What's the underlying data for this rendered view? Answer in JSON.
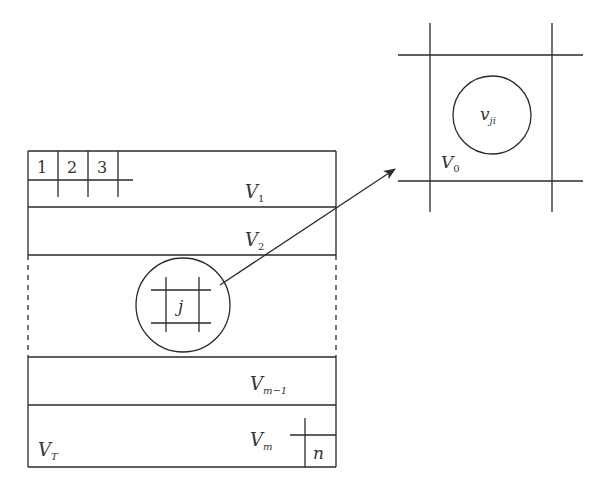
{
  "diagram": {
    "main_grid": {
      "bands": [
        {
          "label": "V",
          "sub": "1"
        },
        {
          "label": "V",
          "sub": "2"
        },
        {
          "label": "V",
          "sub": "m−1"
        },
        {
          "label": "V",
          "sub": "m"
        }
      ],
      "corner_label": {
        "label": "V",
        "sub": "T"
      },
      "top_cells": [
        "1",
        "2",
        "3"
      ],
      "last_cell": "n",
      "zoom_cell_label": "j"
    },
    "detail_view": {
      "cell_label": {
        "label": "V",
        "sub": "0"
      },
      "node_label": {
        "label": "v",
        "sub": "ji"
      }
    },
    "colors": {
      "line": "#2a2a2a",
      "text": "#333333",
      "background": "#ffffff"
    }
  }
}
